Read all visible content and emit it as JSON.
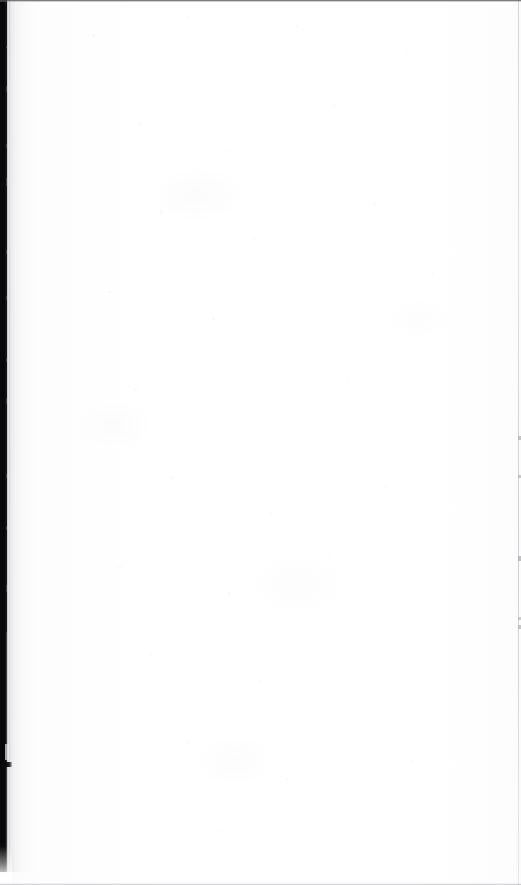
{
  "document": {
    "kind": "scanned-page-image",
    "page_state": "blank",
    "visible_text": "",
    "width_px": 521,
    "height_px": 885
  },
  "artifacts": {
    "gutter": {
      "name": "binding-gutter-shadow",
      "position": "left-edge",
      "color": "#08080a",
      "width_px": 8,
      "extends_to_y_px": 872
    },
    "gutter_tab": {
      "name": "gutter-tab-mark",
      "top_px": 762,
      "height_px": 5,
      "width_px": 12,
      "color": "#08080a"
    },
    "edges": {
      "top_line_color": "#3e3e40",
      "bottom_line_color": "#96969a",
      "right_line_color": "#b2b2b6",
      "right_line_x_px": 518
    },
    "paper": {
      "base_color": "#ffffff",
      "tint_color": "#fdfdfd",
      "speckle_color": "#9c9696"
    }
  }
}
